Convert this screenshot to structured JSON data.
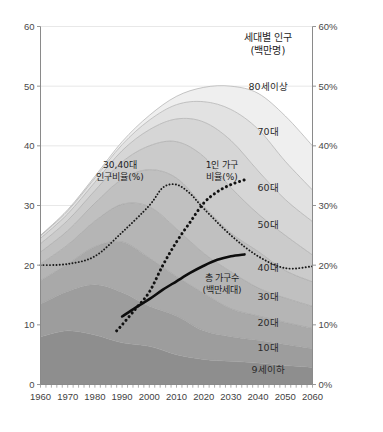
{
  "chart_data": {
    "type": "area",
    "title": "세대별 인구",
    "subtitle": "(백만명)",
    "xlabel": "",
    "ylabel": "",
    "ylabel_right": "",
    "grid": true,
    "legend_position": "inline-right",
    "xlim": [
      1960,
      2060
    ],
    "ylim": [
      0,
      60
    ],
    "ylim_right": [
      0,
      60
    ],
    "x": [
      1960,
      1970,
      1980,
      1990,
      2000,
      2010,
      2020,
      2030,
      2040,
      2050,
      2060
    ],
    "xticks": [
      "1960",
      "1970",
      "1980",
      "1990",
      "2000",
      "2010",
      "2020",
      "2030",
      "2040",
      "2050",
      "2060"
    ],
    "yticks_left": [
      "0",
      "10",
      "20",
      "30",
      "40",
      "50",
      "60"
    ],
    "yticks_right": [
      "0%",
      "10%",
      "20%",
      "30%",
      "40%",
      "50%",
      "60%"
    ],
    "stack_order_bottom_to_top": [
      "9세이하",
      "10대",
      "20대",
      "30대",
      "40대",
      "50대",
      "60대",
      "70대",
      "80세이상"
    ],
    "series": [
      {
        "name": "9세이하",
        "label": "9세이하",
        "color": "#8e8e8e",
        "values": [
          8.0,
          9.0,
          8.3,
          7.0,
          6.4,
          5.0,
          4.2,
          3.9,
          3.6,
          3.2,
          2.9
        ]
      },
      {
        "name": "10대",
        "label": "10대",
        "color": "#9d9d9d",
        "values": [
          5.5,
          6.6,
          8.4,
          8.4,
          6.7,
          6.5,
          4.8,
          4.1,
          3.8,
          3.5,
          3.1
        ]
      },
      {
        "name": "20대",
        "label": "20대",
        "color": "#a9a9a9",
        "values": [
          3.9,
          4.6,
          6.4,
          8.5,
          8.1,
          6.6,
          6.3,
          4.7,
          4.1,
          3.7,
          3.4
        ]
      },
      {
        "name": "30대",
        "label": "30대",
        "color": "#b5b5b5",
        "values": [
          2.8,
          3.2,
          4.3,
          6.3,
          8.6,
          8.0,
          6.7,
          6.2,
          4.7,
          4.1,
          3.7
        ]
      },
      {
        "name": "40대",
        "label": "40대",
        "color": "#c0c0c0",
        "values": [
          2.0,
          2.4,
          3.0,
          4.2,
          6.2,
          8.5,
          7.9,
          6.5,
          6.1,
          4.6,
          4.1
        ]
      },
      {
        "name": "50대",
        "label": "50대",
        "color": "#cbcbcb",
        "values": [
          1.4,
          1.7,
          2.1,
          2.9,
          4.0,
          6.1,
          8.3,
          7.6,
          6.3,
          5.9,
          4.5
        ],
        "_note": ""
      },
      {
        "name": "60대",
        "label": "60대",
        "color": "#d6d6d6",
        "values": [
          0.9,
          1.1,
          1.4,
          1.9,
          2.7,
          3.8,
          5.8,
          7.9,
          7.2,
          6.0,
          5.6
        ]
      },
      {
        "name": "70대",
        "label": "70대",
        "color": "#e2e2e2",
        "values": [
          0.4,
          0.5,
          0.7,
          1.0,
          1.6,
          2.4,
          3.4,
          5.2,
          7.0,
          6.4,
          5.3
        ]
      },
      {
        "name": "80세이상",
        "label": "80세이상",
        "color": "#efefef",
        "values": [
          0.1,
          0.2,
          0.3,
          0.5,
          0.8,
          1.4,
          2.4,
          3.9,
          6.0,
          7.6,
          7.4
        ]
      }
    ],
    "overlays": [
      {
        "name": "30,40대 인구비율(%)",
        "label_line1": "30,40대",
        "label_line2": "인구비율(%)",
        "style": "fine-dotted",
        "axis": "right",
        "color": "#1a1a1a",
        "label_x": 1990,
        "label_y": 37,
        "x": [
          1960,
          1970,
          1980,
          1990,
          2000,
          2005,
          2010,
          2015,
          2020,
          2030,
          2040,
          2050,
          2060
        ],
        "values": [
          20.0,
          20.2,
          21.5,
          25.5,
          30.0,
          33.0,
          33.5,
          32.0,
          29.5,
          25.0,
          21.5,
          19.5,
          19.8
        ]
      },
      {
        "name": "1인 가구 비율(%)",
        "label_line1": "1인 가구",
        "label_line2": "비율(%)",
        "style": "bold-dotted",
        "axis": "right",
        "color": "#111111",
        "label_x": 2018,
        "label_y": 37,
        "x": [
          1988,
          1990,
          1995,
          2000,
          2005,
          2010,
          2015,
          2020,
          2025,
          2030,
          2035
        ],
        "values": [
          9.0,
          10.0,
          12.7,
          15.5,
          20.0,
          23.9,
          27.2,
          30.4,
          32.3,
          33.5,
          34.3
        ]
      },
      {
        "name": "총 가구수 (백만세대)",
        "label_line1": "총 가구수",
        "label_line2": "(백만세대)",
        "style": "solid-thick",
        "axis": "left",
        "color": "#0d0d0d",
        "label_x": 2017,
        "label_y": 18,
        "x": [
          1990,
          1995,
          2000,
          2005,
          2010,
          2015,
          2020,
          2025,
          2030,
          2035
        ],
        "values": [
          11.4,
          12.9,
          14.3,
          15.9,
          17.3,
          18.7,
          19.9,
          20.9,
          21.5,
          21.8
        ]
      }
    ]
  },
  "axes": {
    "left_ticks": [
      "60",
      "50",
      "40",
      "30",
      "20",
      "10",
      "0"
    ],
    "right_ticks": [
      "60%",
      "50%",
      "40%",
      "30%",
      "20%",
      "10%",
      "0%"
    ],
    "x_ticks": [
      "1960",
      "1970",
      "1980",
      "1990",
      "2000",
      "2010",
      "2020",
      "2030",
      "2040",
      "2050",
      "2060"
    ]
  },
  "header": {
    "title": "세대별 인구",
    "subtitle": "(백만명)"
  }
}
